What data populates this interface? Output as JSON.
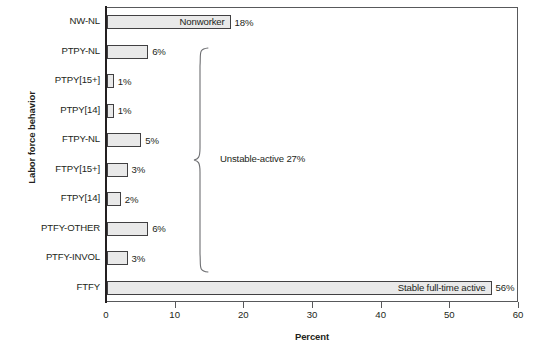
{
  "chart_data": {
    "type": "bar",
    "orientation": "horizontal",
    "title": "",
    "xlabel": "Percent",
    "ylabel": "Labor force behavior",
    "xlim": [
      0,
      60
    ],
    "xticks": [
      0,
      10,
      20,
      30,
      40,
      50,
      60
    ],
    "xtick_labels": [
      "0",
      "10",
      "20",
      "30",
      "40",
      "50",
      "60"
    ],
    "grid": false,
    "legend": "none",
    "categories": [
      "NW-NL",
      "PTPY-NL",
      "PTPY[15+]",
      "PTPY[14]",
      "FTPY-NL",
      "FTPY[15+]",
      "FTPY[14]",
      "PTFY-OTHER",
      "PTFY-INVOL",
      "FTFY"
    ],
    "values": [
      18,
      6,
      1,
      1,
      5,
      3,
      2,
      6,
      3,
      56
    ],
    "value_labels": [
      "18%",
      "6%",
      "1%",
      "1%",
      "5%",
      "3%",
      "2%",
      "6%",
      "3%",
      "56%"
    ],
    "bar_inner_labels": [
      "Nonworker",
      "",
      "",
      "",
      "",
      "",
      "",
      "",
      "",
      "Stable full-time active"
    ],
    "annotations": [
      {
        "name": "unstable-active-brace",
        "text": "Unstable-active 27%",
        "spans_categories": [
          "PTPY-NL",
          "PTFY-INVOL"
        ]
      }
    ],
    "colors": {
      "bar_fill": "#e9e9e9",
      "bar_border": "#414042",
      "axis": "#231f20",
      "frame": "#58595b",
      "text": "#231f20",
      "background": "#ffffff"
    }
  },
  "axis": {
    "y_title": "Labor force behavior",
    "x_title": "Percent"
  }
}
